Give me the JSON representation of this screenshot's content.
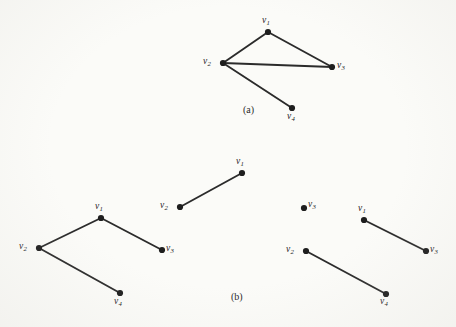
{
  "figure": {
    "background_color": "#fbfbf8",
    "ink_color": "#2b2b2b",
    "vertex_color": "#1e1e1e"
  },
  "panels": [
    {
      "id": "panel-a",
      "caption": "(a)",
      "caption_pos": {
        "x": 243,
        "y": 104
      },
      "vertices": [
        {
          "id": "v1",
          "label": "v",
          "sub": "1",
          "x": 268,
          "y": 32,
          "label_x": 262,
          "label_y": 16
        },
        {
          "id": "v2",
          "label": "v",
          "sub": "2",
          "x": 223,
          "y": 63,
          "label_x": 203,
          "label_y": 57
        },
        {
          "id": "v3",
          "label": "v",
          "sub": "3",
          "x": 332,
          "y": 67,
          "label_x": 337,
          "label_y": 61
        },
        {
          "id": "v4",
          "label": "v",
          "sub": "4",
          "x": 292,
          "y": 108,
          "label_x": 287,
          "label_y": 112
        }
      ],
      "edges": [
        {
          "from": "v1",
          "to": "v2"
        },
        {
          "from": "v1",
          "to": "v3"
        },
        {
          "from": "v2",
          "to": "v3"
        },
        {
          "from": "v2",
          "to": "v4"
        }
      ]
    },
    {
      "id": "panel-b-graph-1",
      "caption": "",
      "caption_pos": null,
      "vertices": [
        {
          "id": "v1",
          "label": "v",
          "sub": "1",
          "x": 101,
          "y": 218,
          "label_x": 95,
          "label_y": 202
        },
        {
          "id": "v2",
          "label": "v",
          "sub": "2",
          "x": 39,
          "y": 248,
          "label_x": 19,
          "label_y": 242
        },
        {
          "id": "v3",
          "label": "v",
          "sub": "3",
          "x": 162,
          "y": 250,
          "label_x": 166,
          "label_y": 244
        },
        {
          "id": "v4",
          "label": "v",
          "sub": "4",
          "x": 120,
          "y": 293,
          "label_x": 114,
          "label_y": 297
        }
      ],
      "edges": [
        {
          "from": "v1",
          "to": "v2"
        },
        {
          "from": "v1",
          "to": "v3"
        },
        {
          "from": "v2",
          "to": "v4"
        }
      ]
    },
    {
      "id": "panel-b-graph-2",
      "caption": "",
      "caption_pos": null,
      "vertices": [
        {
          "id": "v1",
          "label": "v",
          "sub": "1",
          "x": 242,
          "y": 173,
          "label_x": 236,
          "label_y": 157
        },
        {
          "id": "v2",
          "label": "v",
          "sub": "2",
          "x": 180,
          "y": 207,
          "label_x": 160,
          "label_y": 201
        }
      ],
      "edges": [
        {
          "from": "v1",
          "to": "v2"
        }
      ]
    },
    {
      "id": "panel-b-graph-3",
      "caption": "",
      "caption_pos": null,
      "vertices": [
        {
          "id": "v3i",
          "label": "v",
          "sub": "3",
          "x": 304,
          "y": 208,
          "label_x": 308,
          "label_y": 200
        },
        {
          "id": "v1",
          "label": "v",
          "sub": "1",
          "x": 364,
          "y": 220,
          "label_x": 358,
          "label_y": 204
        },
        {
          "id": "v3",
          "label": "v",
          "sub": "3",
          "x": 426,
          "y": 251,
          "label_x": 430,
          "label_y": 245
        },
        {
          "id": "v2",
          "label": "v",
          "sub": "2",
          "x": 306,
          "y": 251,
          "label_x": 286,
          "label_y": 245
        },
        {
          "id": "v4",
          "label": "v",
          "sub": "4",
          "x": 386,
          "y": 294,
          "label_x": 380,
          "label_y": 297
        }
      ],
      "edges": [
        {
          "from": "v1",
          "to": "v3"
        },
        {
          "from": "v2",
          "to": "v4"
        }
      ]
    }
  ],
  "captions": {
    "panel_a": "(a)",
    "panel_b": "(b)",
    "panel_b_pos": {
      "x": 231,
      "y": 291
    }
  }
}
